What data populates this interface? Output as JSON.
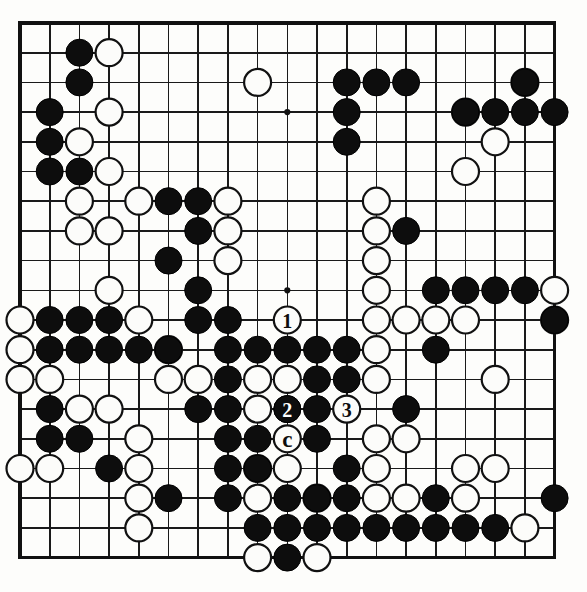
{
  "diagram": {
    "kind": "go-board-diagram",
    "board_size": 19,
    "colors": {
      "background": "#fdfdfb",
      "line": "#1a1a1a",
      "border": "#111111",
      "black_stone": "#0d0d0d",
      "white_stone": "#fcfcfa"
    },
    "geometry": {
      "origin_x": 20,
      "origin_y": 23,
      "spacing": 29.7,
      "stone_radius": 13.5
    },
    "hoshi_points": [
      [
        3,
        3
      ],
      [
        9,
        3
      ],
      [
        15,
        3
      ],
      [
        3,
        9
      ],
      [
        9,
        9
      ],
      [
        15,
        9
      ],
      [
        3,
        15
      ],
      [
        9,
        15
      ],
      [
        15,
        15
      ]
    ],
    "black_stones": [
      [
        2,
        1
      ],
      [
        2,
        2
      ],
      [
        1,
        3
      ],
      [
        1,
        4
      ],
      [
        1,
        5
      ],
      [
        2,
        5
      ],
      [
        11,
        2
      ],
      [
        12,
        2
      ],
      [
        13,
        2
      ],
      [
        17,
        2
      ],
      [
        11,
        3
      ],
      [
        15,
        3
      ],
      [
        16,
        3
      ],
      [
        17,
        3
      ],
      [
        18,
        3
      ],
      [
        11,
        4
      ],
      [
        5,
        6
      ],
      [
        6,
        6
      ],
      [
        11,
        4
      ],
      [
        5,
        6
      ],
      [
        6,
        6
      ],
      [
        6,
        7
      ],
      [
        5,
        8
      ],
      [
        6,
        9
      ],
      [
        13,
        7
      ],
      [
        13,
        2
      ],
      [
        14,
        9
      ],
      [
        15,
        9
      ],
      [
        16,
        9
      ],
      [
        17,
        9
      ],
      [
        18,
        10
      ],
      [
        1,
        10
      ],
      [
        2,
        10
      ],
      [
        3,
        10
      ],
      [
        6,
        10
      ],
      [
        7,
        10
      ],
      [
        1,
        11
      ],
      [
        2,
        11
      ],
      [
        3,
        11
      ],
      [
        4,
        11
      ],
      [
        5,
        11
      ],
      [
        7,
        11
      ],
      [
        8,
        11
      ],
      [
        9,
        11
      ],
      [
        10,
        11
      ],
      [
        11,
        11
      ],
      [
        14,
        11
      ],
      [
        7,
        12
      ],
      [
        10,
        12
      ],
      [
        11,
        12
      ],
      [
        6,
        13
      ],
      [
        7,
        13
      ],
      [
        9,
        13
      ],
      [
        10,
        13
      ],
      [
        13,
        13
      ],
      [
        1,
        13
      ],
      [
        7,
        14
      ],
      [
        8,
        14
      ],
      [
        10,
        14
      ],
      [
        1,
        14
      ],
      [
        2,
        14
      ],
      [
        7,
        15
      ],
      [
        8,
        15
      ],
      [
        11,
        15
      ],
      [
        3,
        15
      ],
      [
        5,
        16
      ],
      [
        7,
        16
      ],
      [
        9,
        16
      ],
      [
        10,
        16
      ],
      [
        11,
        16
      ],
      [
        14,
        16
      ],
      [
        8,
        17
      ],
      [
        9,
        17
      ],
      [
        10,
        17
      ],
      [
        11,
        17
      ],
      [
        12,
        17
      ],
      [
        13,
        17
      ],
      [
        14,
        17
      ],
      [
        15,
        17
      ],
      [
        16,
        17
      ],
      [
        9,
        18
      ],
      [
        18,
        16
      ]
    ],
    "white_stones": [
      [
        3,
        1
      ],
      [
        8,
        2
      ],
      [
        17,
        2
      ],
      [
        3,
        3
      ],
      [
        15,
        3
      ],
      [
        2,
        4
      ],
      [
        16,
        4
      ],
      [
        3,
        5
      ],
      [
        15,
        5
      ],
      [
        2,
        6
      ],
      [
        4,
        6
      ],
      [
        7,
        6
      ],
      [
        12,
        6
      ],
      [
        2,
        7
      ],
      [
        3,
        7
      ],
      [
        7,
        7
      ],
      [
        12,
        7
      ],
      [
        7,
        8
      ],
      [
        12,
        8
      ],
      [
        12,
        6
      ],
      [
        3,
        9
      ],
      [
        12,
        9
      ],
      [
        18,
        9
      ],
      [
        12,
        9
      ],
      [
        0,
        10
      ],
      [
        4,
        10
      ],
      [
        12,
        10
      ],
      [
        13,
        10
      ],
      [
        14,
        10
      ],
      [
        15,
        10
      ],
      [
        18,
        10
      ],
      [
        0,
        11
      ],
      [
        5,
        11
      ],
      [
        12,
        11
      ],
      [
        0,
        12
      ],
      [
        5,
        12
      ],
      [
        6,
        12
      ],
      [
        8,
        12
      ],
      [
        9,
        12
      ],
      [
        12,
        12
      ],
      [
        16,
        12
      ],
      [
        1,
        12
      ],
      [
        2,
        13
      ],
      [
        3,
        13
      ],
      [
        8,
        13
      ],
      [
        4,
        14
      ],
      [
        9,
        14
      ],
      [
        12,
        14
      ],
      [
        13,
        14
      ],
      [
        0,
        15
      ],
      [
        1,
        15
      ],
      [
        4,
        15
      ],
      [
        8,
        15
      ],
      [
        9,
        15
      ],
      [
        12,
        15
      ],
      [
        15,
        15
      ],
      [
        16,
        15
      ],
      [
        4,
        16
      ],
      [
        8,
        16
      ],
      [
        10,
        16
      ],
      [
        12,
        16
      ],
      [
        13,
        16
      ],
      [
        15,
        16
      ],
      [
        4,
        17
      ],
      [
        17,
        17
      ],
      [
        8,
        18
      ],
      [
        10,
        18
      ]
    ],
    "numbered_moves": [
      {
        "number": "1",
        "col": 9,
        "row": 10,
        "color": "white"
      },
      {
        "number": "2",
        "col": 9,
        "row": 13,
        "color": "black"
      },
      {
        "number": "3",
        "col": 11,
        "row": 13,
        "color": "white"
      }
    ],
    "letter_labels": [
      {
        "letter": "a",
        "col": 7,
        "row": 12
      },
      {
        "letter": "b",
        "col": 10,
        "row": 12
      },
      {
        "letter": "c",
        "col": 9,
        "row": 14
      },
      {
        "letter": "d",
        "col": 9,
        "row": 16
      }
    ]
  }
}
